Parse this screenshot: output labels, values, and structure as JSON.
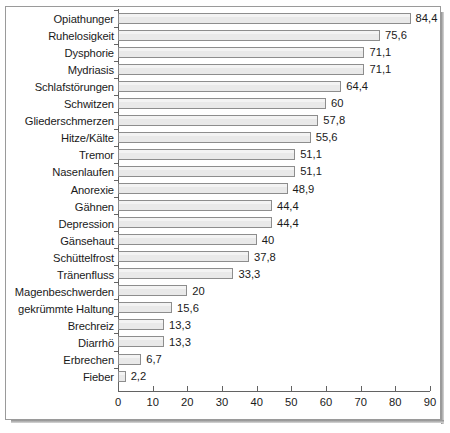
{
  "chart_data": {
    "type": "bar",
    "orientation": "horizontal",
    "title": "",
    "subtitle": "",
    "xlabel": "",
    "ylabel": "",
    "xlim": [
      0,
      90
    ],
    "xticks": [
      "0",
      "10",
      "20",
      "30",
      "40",
      "50",
      "60",
      "70",
      "80",
      "90"
    ],
    "xtick_values": [
      0,
      10,
      20,
      30,
      40,
      50,
      60,
      70,
      80,
      90
    ],
    "grid": false,
    "legend": false,
    "categories": [
      "Opiathunger",
      "Ruhelosigkeit",
      "Dysphorie",
      "Mydriasis",
      "Schlafstörungen",
      "Schwitzen",
      "Gliederschmerzen",
      "Hitze/Kälte",
      "Tremor",
      "Nasenlaufen",
      "Anorexie",
      "Gähnen",
      "Depression",
      "Gänsehaut",
      "Schüttelfrost",
      "Tränenfluss",
      "Magenbeschwerden",
      "gekrümmte Haltung",
      "Brechreiz",
      "Diarrhö",
      "Erbrechen",
      "Fieber"
    ],
    "values": [
      84.4,
      75.6,
      71.1,
      71.1,
      64.4,
      60,
      57.8,
      55.6,
      51.1,
      51.1,
      48.9,
      44.4,
      44.4,
      40,
      37.8,
      33.3,
      20,
      15.6,
      13.3,
      13.3,
      6.7,
      2.2
    ],
    "value_labels": [
      "84,4",
      "75,6",
      "71,1",
      "71,1",
      "64,4",
      "60",
      "57,8",
      "55,6",
      "51,1",
      "51,1",
      "48,9",
      "44,4",
      "44,4",
      "40",
      "37,8",
      "33,3",
      "20",
      "15,6",
      "13,3",
      "13,3",
      "6,7",
      "2,2"
    ],
    "colors": {
      "bar_fill": "#e9e9e9",
      "bar_border": "#8d8d8d",
      "axis": "#636363",
      "text": "#1a1a1a",
      "background": "#ffffff",
      "frame": "#9a9a9a"
    }
  }
}
